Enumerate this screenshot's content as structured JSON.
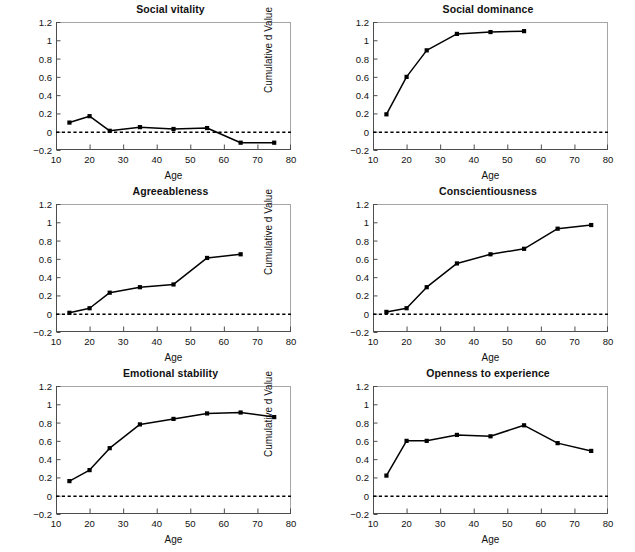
{
  "figure": {
    "axis_label_x": "Age",
    "axis_label_y": "Cumulative d Value",
    "xticks": [
      "10",
      "20",
      "30",
      "40",
      "50",
      "60",
      "70",
      "80"
    ],
    "yticks": [
      "1.2",
      "1",
      "0.8",
      "0.6",
      "0.4",
      "0.2",
      "0",
      "-0.2"
    ],
    "colors": {
      "line": "#000000",
      "marker": "#000000",
      "frame": "#a6a6a6",
      "axis": "#4d4d4d",
      "zero_reference": "#000000",
      "background": "#ffffff"
    }
  },
  "chart_data": [
    {
      "type": "line",
      "title": "Social vitality",
      "xlabel": "Age",
      "ylabel": "Cumulative d Value",
      "xlim": [
        10,
        80
      ],
      "ylim": [
        -0.2,
        1.2
      ],
      "grid": false,
      "legend": null,
      "zero_line": 0,
      "x": [
        14,
        20,
        26,
        35,
        45,
        55,
        65,
        75
      ],
      "values": [
        0.1,
        0.17,
        0.01,
        0.05,
        0.03,
        0.04,
        -0.12,
        -0.12
      ]
    },
    {
      "type": "line",
      "title": "Social dominance",
      "xlabel": "Age",
      "ylabel": "Cumulative d Value",
      "xlim": [
        10,
        80
      ],
      "ylim": [
        -0.2,
        1.2
      ],
      "grid": false,
      "legend": null,
      "zero_line": 0,
      "x": [
        14,
        20,
        26,
        35,
        45,
        55
      ],
      "values": [
        0.19,
        0.6,
        0.89,
        1.07,
        1.09,
        1.1
      ]
    },
    {
      "type": "line",
      "title": "Agreeableness",
      "xlabel": "Age",
      "ylabel": "Cumulative d Value",
      "xlim": [
        10,
        80
      ],
      "ylim": [
        -0.2,
        1.2
      ],
      "grid": false,
      "legend": null,
      "zero_line": 0,
      "x": [
        14,
        20,
        26,
        35,
        45,
        55,
        65
      ],
      "values": [
        0.01,
        0.06,
        0.23,
        0.29,
        0.32,
        0.61,
        0.65
      ]
    },
    {
      "type": "line",
      "title": "Conscientiousness",
      "xlabel": "Age",
      "ylabel": "Cumulative d Value",
      "xlim": [
        10,
        80
      ],
      "ylim": [
        -0.2,
        1.2
      ],
      "grid": false,
      "legend": null,
      "zero_line": 0,
      "x": [
        14,
        20,
        26,
        35,
        45,
        55,
        65,
        75
      ],
      "values": [
        0.02,
        0.06,
        0.29,
        0.55,
        0.65,
        0.71,
        0.93,
        0.97
      ]
    },
    {
      "type": "line",
      "title": "Emotional stability",
      "xlabel": "Age",
      "ylabel": "Cumulative d Value",
      "xlim": [
        10,
        80
      ],
      "ylim": [
        -0.2,
        1.2
      ],
      "grid": false,
      "legend": null,
      "zero_line": 0,
      "x": [
        14,
        20,
        26,
        35,
        45,
        55,
        65,
        75
      ],
      "values": [
        0.16,
        0.28,
        0.52,
        0.78,
        0.84,
        0.9,
        0.91,
        0.86
      ]
    },
    {
      "type": "line",
      "title": "Openness to experience",
      "xlabel": "Age",
      "ylabel": "Cumulative d Value",
      "xlim": [
        10,
        80
      ],
      "ylim": [
        -0.2,
        1.2
      ],
      "grid": false,
      "legend": null,
      "zero_line": 0,
      "x": [
        14,
        20,
        26,
        35,
        45,
        55,
        65,
        75
      ],
      "values": [
        0.22,
        0.6,
        0.6,
        0.665,
        0.65,
        0.77,
        0.575,
        0.49
      ]
    }
  ]
}
